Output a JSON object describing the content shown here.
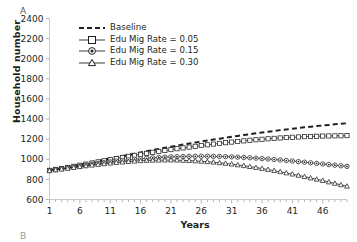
{
  "panel": {
    "label": "A",
    "next_label": "B"
  },
  "chart_data": {
    "type": "line",
    "title": "",
    "xlabel": "Years",
    "ylabel": "Household number",
    "xlim": [
      1,
      50
    ],
    "ylim": [
      600,
      2400
    ],
    "ytick_step": 200,
    "yticks": [
      600,
      800,
      1000,
      1200,
      1400,
      1600,
      1800,
      2000,
      2200,
      2400
    ],
    "xticks": [
      1,
      6,
      11,
      16,
      21,
      26,
      31,
      36,
      41,
      46
    ],
    "x_minor_tick_step": 1,
    "grid": false,
    "legend_position": "top-left-inside",
    "x": [
      1,
      2,
      3,
      4,
      5,
      6,
      7,
      8,
      9,
      10,
      11,
      12,
      13,
      14,
      15,
      16,
      17,
      18,
      19,
      20,
      21,
      22,
      23,
      24,
      25,
      26,
      27,
      28,
      29,
      30,
      31,
      32,
      33,
      34,
      35,
      36,
      37,
      38,
      39,
      40,
      41,
      42,
      43,
      44,
      45,
      46,
      47,
      48,
      49,
      50
    ],
    "series": [
      {
        "name": "Baseline",
        "style": "dashed",
        "marker": "none",
        "values": [
          893,
          903,
          913,
          924,
          936,
          948,
          960,
          972,
          984,
          996,
          1008,
          1020,
          1032,
          1044,
          1056,
          1068,
          1080,
          1092,
          1103,
          1114,
          1125,
          1136,
          1146,
          1156,
          1166,
          1176,
          1186,
          1196,
          1205,
          1214,
          1223,
          1232,
          1241,
          1250,
          1258,
          1266,
          1274,
          1282,
          1290,
          1297,
          1304,
          1311,
          1318,
          1324,
          1330,
          1336,
          1342,
          1348,
          1353,
          1358
        ]
      },
      {
        "name": "Edu Mig Rate = 0.05",
        "style": "solid",
        "marker": "square",
        "values": [
          890,
          899,
          909,
          919,
          930,
          941,
          952,
          963,
          974,
          985,
          996,
          1007,
          1018,
          1029,
          1039,
          1049,
          1059,
          1069,
          1078,
          1087,
          1096,
          1105,
          1113,
          1121,
          1129,
          1137,
          1144,
          1151,
          1158,
          1165,
          1171,
          1177,
          1183,
          1189,
          1194,
          1199,
          1204,
          1208,
          1212,
          1216,
          1219,
          1222,
          1225,
          1227,
          1229,
          1231,
          1232,
          1233,
          1234,
          1235
        ]
      },
      {
        "name": "Edu Mig Rate = 0.15",
        "style": "solid",
        "marker": "circle-dot",
        "values": [
          888,
          896,
          905,
          914,
          923,
          932,
          941,
          950,
          958,
          966,
          974,
          981,
          988,
          994,
          1000,
          1005,
          1010,
          1014,
          1018,
          1021,
          1024,
          1026,
          1028,
          1029,
          1030,
          1030,
          1030,
          1029,
          1028,
          1026,
          1024,
          1021,
          1018,
          1015,
          1011,
          1007,
          1003,
          998,
          993,
          988,
          983,
          977,
          971,
          965,
          959,
          953,
          947,
          941,
          935,
          929
        ]
      },
      {
        "name": "Edu Mig Rate = 0.30",
        "style": "solid",
        "marker": "triangle",
        "values": [
          886,
          894,
          902,
          910,
          918,
          926,
          934,
          941,
          948,
          955,
          961,
          967,
          972,
          977,
          981,
          985,
          988,
          990,
          991,
          992,
          992,
          991,
          989,
          987,
          984,
          980,
          976,
          971,
          965,
          959,
          952,
          944,
          936,
          927,
          918,
          908,
          898,
          887,
          876,
          864,
          852,
          840,
          827,
          814,
          801,
          788,
          774,
          760,
          746,
          732
        ]
      }
    ]
  },
  "legend": {
    "items": [
      {
        "label": "Baseline"
      },
      {
        "label": "Edu Mig Rate = 0.05"
      },
      {
        "label": "Edu Mig Rate = 0.15"
      },
      {
        "label": "Edu Mig Rate = 0.30"
      }
    ]
  }
}
